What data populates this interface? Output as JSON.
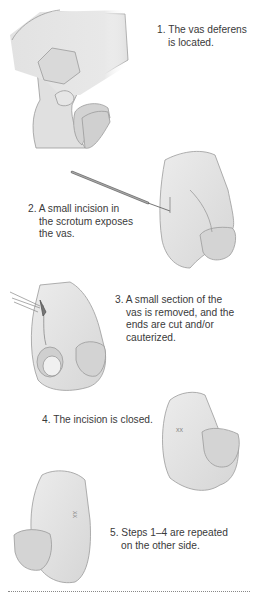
{
  "figure": {
    "colors": {
      "skin": "#e4e4e4",
      "skin_shadow": "#cfcfcf",
      "outline": "#9a9a9a",
      "text": "#3a3a3a",
      "rule": "#888888"
    },
    "steps": [
      {
        "number": "1.",
        "line1": "The vas deferens",
        "line2": "is located."
      },
      {
        "number": "2.",
        "line1": "A small incision in",
        "line2": "the scrotum exposes",
        "line3": "the vas."
      },
      {
        "number": "3.",
        "line1": "A small section of the",
        "line2": "vas is removed, and the",
        "line3": "ends are cut and/or",
        "line4": "cauterized."
      },
      {
        "number": "4.",
        "line1": "The incision is closed."
      },
      {
        "number": "5.",
        "line1": "Steps 1–4 are repeated",
        "line2": "on the other side."
      }
    ]
  }
}
